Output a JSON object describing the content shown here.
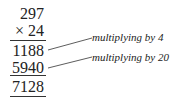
{
  "calculation": {
    "multiplicand": "297",
    "multiplier": "× 24",
    "partial_products": [
      "1188",
      "5940"
    ],
    "result": "7128"
  },
  "annotations": [
    {
      "label": "multiplying by 4"
    },
    {
      "label": "multiplying by 20"
    }
  ]
}
